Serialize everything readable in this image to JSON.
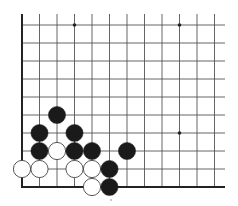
{
  "diagram": {
    "type": "go-board-corner",
    "corner": "bottom-left",
    "columns_visible": 12,
    "rows_visible": 10,
    "colors": {
      "background": "#ffffff",
      "grid": "#555555",
      "edge": "#222222",
      "black_stone": "#1a1a1a",
      "white_stone": "#ffffff",
      "white_stone_outline": "#444444"
    },
    "grid": {
      "x0": 22,
      "y0": 25,
      "dx": 17.5,
      "dy": 18,
      "right_extent": 225,
      "top_extent": 14
    },
    "star_points": [
      {
        "col": 3,
        "row": 0
      },
      {
        "col": 9,
        "row": 0
      },
      {
        "col": 9,
        "row": 6
      }
    ],
    "stones": [
      {
        "color": "black",
        "col": 2,
        "row": 5
      },
      {
        "color": "black",
        "col": 1,
        "row": 6
      },
      {
        "color": "black",
        "col": 3,
        "row": 6
      },
      {
        "color": "black",
        "col": 1,
        "row": 7
      },
      {
        "color": "white",
        "col": 2,
        "row": 7
      },
      {
        "color": "black",
        "col": 3,
        "row": 7
      },
      {
        "color": "black",
        "col": 4,
        "row": 7
      },
      {
        "color": "black",
        "col": 6,
        "row": 7
      },
      {
        "color": "white",
        "col": 0,
        "row": 8
      },
      {
        "color": "white",
        "col": 1,
        "row": 8
      },
      {
        "color": "white",
        "col": 3,
        "row": 8
      },
      {
        "color": "white",
        "col": 4,
        "row": 8
      },
      {
        "color": "black",
        "col": 5,
        "row": 8
      },
      {
        "color": "white",
        "col": 4,
        "row": 9
      },
      {
        "color": "black",
        "col": 5,
        "row": 9
      }
    ],
    "marks": [
      {
        "type": "speck",
        "x": 111,
        "y": 200
      }
    ]
  }
}
